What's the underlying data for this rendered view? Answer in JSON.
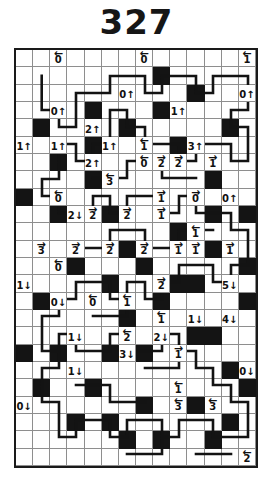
{
  "puzzle": {
    "title": "327",
    "grid": {
      "columns": 14,
      "rows": 24
    },
    "colors": {
      "ink": "#131313",
      "black_cell": "#141414",
      "grid_line": "#8e8e8e",
      "background": "#ffffff"
    },
    "black_cells": [
      [
        1,
        4
      ],
      [
        2,
        6
      ],
      [
        4,
        3
      ],
      [
        4,
        5
      ],
      [
        4,
        7
      ],
      [
        5,
        9
      ],
      [
        6,
        2
      ],
      [
        6,
        4
      ],
      [
        7,
        6
      ],
      [
        8,
        1
      ],
      [
        8,
        3
      ],
      [
        9,
        5
      ],
      [
        10,
        2
      ],
      [
        11,
        7
      ],
      [
        12,
        4
      ],
      [
        13,
        9
      ],
      [
        0,
        8
      ],
      [
        2,
        9
      ],
      [
        5,
        13
      ],
      [
        7,
        12
      ],
      [
        9,
        10
      ],
      [
        10,
        13
      ],
      [
        11,
        11
      ],
      [
        13,
        12
      ],
      [
        1,
        14
      ],
      [
        3,
        16
      ],
      [
        6,
        15
      ],
      [
        8,
        14
      ],
      [
        9,
        17
      ],
      [
        11,
        16
      ],
      [
        12,
        18
      ],
      [
        13,
        14
      ],
      [
        2,
        17
      ],
      [
        4,
        19
      ],
      [
        5,
        21
      ],
      [
        7,
        20
      ],
      [
        8,
        22
      ],
      [
        10,
        20
      ],
      [
        12,
        21
      ],
      [
        13,
        19
      ],
      [
        0,
        17
      ],
      [
        3,
        12
      ],
      [
        6,
        11
      ],
      [
        9,
        13
      ],
      [
        11,
        9
      ],
      [
        12,
        8
      ],
      [
        5,
        17
      ],
      [
        1,
        19
      ],
      [
        3,
        21
      ],
      [
        6,
        22
      ],
      [
        11,
        22
      ],
      [
        12,
        15
      ],
      [
        10,
        16
      ],
      [
        7,
        17
      ]
    ],
    "clues": [
      {
        "row": 0,
        "col": 2,
        "value": "0",
        "direction": "left",
        "arrow": "←"
      },
      {
        "row": 0,
        "col": 7,
        "value": "0",
        "direction": "left",
        "arrow": "←"
      },
      {
        "row": 0,
        "col": 13,
        "value": "1",
        "direction": "left",
        "arrow": "←"
      },
      {
        "row": 2,
        "col": 6,
        "value": "0",
        "direction": "up",
        "arrow": "↑"
      },
      {
        "row": 2,
        "col": 13,
        "value": "0",
        "direction": "up",
        "arrow": "↑"
      },
      {
        "row": 3,
        "col": 2,
        "value": "0",
        "direction": "up",
        "arrow": "↑"
      },
      {
        "row": 3,
        "col": 9,
        "value": "1",
        "direction": "up",
        "arrow": "↑"
      },
      {
        "row": 4,
        "col": 4,
        "value": "2",
        "direction": "up",
        "arrow": "↑"
      },
      {
        "row": 5,
        "col": 0,
        "value": "1",
        "direction": "up",
        "arrow": "↑"
      },
      {
        "row": 5,
        "col": 2,
        "value": "1",
        "direction": "up",
        "arrow": "↑"
      },
      {
        "row": 5,
        "col": 5,
        "value": "1",
        "direction": "up",
        "arrow": "↑"
      },
      {
        "row": 5,
        "col": 7,
        "value": "1",
        "direction": "left",
        "arrow": "←"
      },
      {
        "row": 5,
        "col": 10,
        "value": "3",
        "direction": "up",
        "arrow": "↑"
      },
      {
        "row": 6,
        "col": 4,
        "value": "2",
        "direction": "up",
        "arrow": "↑"
      },
      {
        "row": 6,
        "col": 7,
        "value": "0",
        "direction": "left",
        "arrow": "←"
      },
      {
        "row": 6,
        "col": 8,
        "value": "2",
        "direction": "right",
        "arrow": "→"
      },
      {
        "row": 6,
        "col": 9,
        "value": "2",
        "direction": "right",
        "arrow": "→"
      },
      {
        "row": 6,
        "col": 11,
        "value": "1",
        "direction": "right",
        "arrow": "→"
      },
      {
        "row": 7,
        "col": 5,
        "value": "3",
        "direction": "left",
        "arrow": "←"
      },
      {
        "row": 8,
        "col": 2,
        "value": "0",
        "direction": "left",
        "arrow": "←"
      },
      {
        "row": 8,
        "col": 8,
        "value": "1",
        "direction": "right",
        "arrow": "→"
      },
      {
        "row": 8,
        "col": 10,
        "value": "0",
        "direction": "right",
        "arrow": "→"
      },
      {
        "row": 8,
        "col": 12,
        "value": "0",
        "direction": "up",
        "arrow": "↑"
      },
      {
        "row": 9,
        "col": 3,
        "value": "2",
        "direction": "down",
        "arrow": "↓"
      },
      {
        "row": 9,
        "col": 4,
        "value": "2",
        "direction": "right",
        "arrow": "→"
      },
      {
        "row": 9,
        "col": 6,
        "value": "2",
        "direction": "right",
        "arrow": "→"
      },
      {
        "row": 9,
        "col": 8,
        "value": "1",
        "direction": "right",
        "arrow": "→"
      },
      {
        "row": 10,
        "col": 10,
        "value": "1",
        "direction": "left",
        "arrow": "←"
      },
      {
        "row": 11,
        "col": 1,
        "value": "3",
        "direction": "right",
        "arrow": "→"
      },
      {
        "row": 11,
        "col": 3,
        "value": "2",
        "direction": "right",
        "arrow": "→"
      },
      {
        "row": 11,
        "col": 5,
        "value": "2",
        "direction": "right",
        "arrow": "→"
      },
      {
        "row": 11,
        "col": 7,
        "value": "2",
        "direction": "right",
        "arrow": "→"
      },
      {
        "row": 11,
        "col": 9,
        "value": "1",
        "direction": "right",
        "arrow": "→"
      },
      {
        "row": 11,
        "col": 10,
        "value": "1",
        "direction": "right",
        "arrow": "→"
      },
      {
        "row": 11,
        "col": 12,
        "value": "1",
        "direction": "right",
        "arrow": "→"
      },
      {
        "row": 12,
        "col": 2,
        "value": "0",
        "direction": "left",
        "arrow": "←"
      },
      {
        "row": 13,
        "col": 0,
        "value": "1",
        "direction": "down",
        "arrow": "↓"
      },
      {
        "row": 13,
        "col": 8,
        "value": "2",
        "direction": "right",
        "arrow": "→"
      },
      {
        "row": 13,
        "col": 12,
        "value": "5",
        "direction": "down",
        "arrow": "↓"
      },
      {
        "row": 14,
        "col": 2,
        "value": "0",
        "direction": "down",
        "arrow": "↓"
      },
      {
        "row": 14,
        "col": 4,
        "value": "0",
        "direction": "left",
        "arrow": "←"
      },
      {
        "row": 14,
        "col": 6,
        "value": "1",
        "direction": "left",
        "arrow": "←"
      },
      {
        "row": 15,
        "col": 8,
        "value": "1",
        "direction": "left",
        "arrow": "←"
      },
      {
        "row": 15,
        "col": 10,
        "value": "1",
        "direction": "down",
        "arrow": "↓"
      },
      {
        "row": 15,
        "col": 12,
        "value": "4",
        "direction": "down",
        "arrow": "↓"
      },
      {
        "row": 16,
        "col": 3,
        "value": "1",
        "direction": "down",
        "arrow": "↓"
      },
      {
        "row": 16,
        "col": 6,
        "value": "2",
        "direction": "left",
        "arrow": "←"
      },
      {
        "row": 16,
        "col": 8,
        "value": "2",
        "direction": "down",
        "arrow": "↓"
      },
      {
        "row": 17,
        "col": 6,
        "value": "3",
        "direction": "down",
        "arrow": "↓"
      },
      {
        "row": 17,
        "col": 9,
        "value": "1",
        "direction": "right",
        "arrow": "→"
      },
      {
        "row": 18,
        "col": 3,
        "value": "1",
        "direction": "down",
        "arrow": "↓"
      },
      {
        "row": 18,
        "col": 13,
        "value": "0",
        "direction": "down",
        "arrow": "↓"
      },
      {
        "row": 19,
        "col": 9,
        "value": "1",
        "direction": "left",
        "arrow": "←"
      },
      {
        "row": 20,
        "col": 0,
        "value": "0",
        "direction": "down",
        "arrow": "↓"
      },
      {
        "row": 20,
        "col": 9,
        "value": "3",
        "direction": "left",
        "arrow": "←"
      },
      {
        "row": 20,
        "col": 11,
        "value": "3",
        "direction": "left",
        "arrow": "←"
      },
      {
        "row": 23,
        "col": 13,
        "value": "2",
        "direction": "left",
        "arrow": "←"
      }
    ],
    "loop_path": "M 25.7,25.7 L 25.7,60 L 43,60 L 43,77 L 60,77 L 60,43 L 94,43 L 94,26 L 129,26 L 129,43 L 146,43 L 146,26 L 180,26 L 180,43 L 197,43 L 197,26 L 232,26 L 232,60 L 215,60 L 215,77 L 232,77 L 232,111 L 215,111 L 215,94 L 180,94 L 180,111 L 163,111 L 163,94 L 129,94 L 129,77 L 111,77 L 111,60 L 94,60 L 94,94 L 77,94 L 77,111 L 60,111 L 60,94 L 43,94 L 43,129 L 26,129 L 26,146 L 43,146 L 43,163 L 77,163 L 77,146 L 94,146 L 94,163 L 111,163 L 111,146 L 146,146 L 146,163 L 163,163 L 163,146 L 180,146 L 180,163 L 215,163 L 215,180 L 232,180 L 232,215 L 215,215 L 215,232 L 197,232 L 197,215 L 163,215 L 163,232 L 146,232 L 146,249 L 129,249 L 129,232 L 111,232 L 111,249 L 94,249 L 94,232 L 60,232 L 60,249 L 43,249 L 43,266 L 26,266 L 26,301 L 43,301 L 43,284 L 60,284 L 60,301 L 94,301 L 94,284 L 111,284 L 111,301 L 146,301 L 146,284 L 163,284 L 163,301 L 180,301 L 180,318 L 197,318 L 197,335 L 215,335 L 215,352 L 232,352 L 232,387 L 197,387 L 197,370 L 163,370 L 163,387 L 146,387 L 146,370 L 111,370 L 111,387 L 94,387 L 94,370 L 60,370 L 60,387 L 43,387 L 43,352 L 26,352 L 26,318 L 43,318 L 43,301 M 77,128 L 111,128 L 111,111 L 146,111 L 146,128 L 180,128 M 60,198 L 94,198 L 94,180 L 129,180 L 129,198 L 163,198 L 163,180 L 197,180 M 77,266 L 111,266 L 111,249 M 129,318 L 163,318 L 163,301 M 60,335 L 94,335 L 94,352 L 129,352 M 111,404 L 146,404 L 146,387 M 180,404 L 215,404"
  }
}
